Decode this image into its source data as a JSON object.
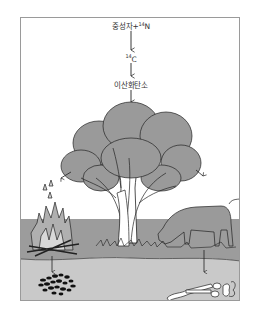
{
  "diagram": {
    "steps": [
      {
        "id": "source",
        "prefix": "중성자+",
        "isotope_mass": "14",
        "isotope_symbol": "N"
      },
      {
        "id": "c14",
        "isotope_mass": "14",
        "isotope_symbol": "C"
      },
      {
        "id": "co2",
        "text": "이산화탄소"
      }
    ],
    "scene": {
      "elements": [
        "tree",
        "campfire",
        "cow",
        "charcoal-deposit",
        "bone-fossils"
      ],
      "colors": {
        "frame_border": "#9a9a9a",
        "sky": "#ffffff",
        "ground": "#9c9c9c",
        "soil": "#c9c9c9",
        "foliage": "#9a9a9a",
        "outline": "#222222",
        "charcoal": "#111111"
      }
    }
  }
}
